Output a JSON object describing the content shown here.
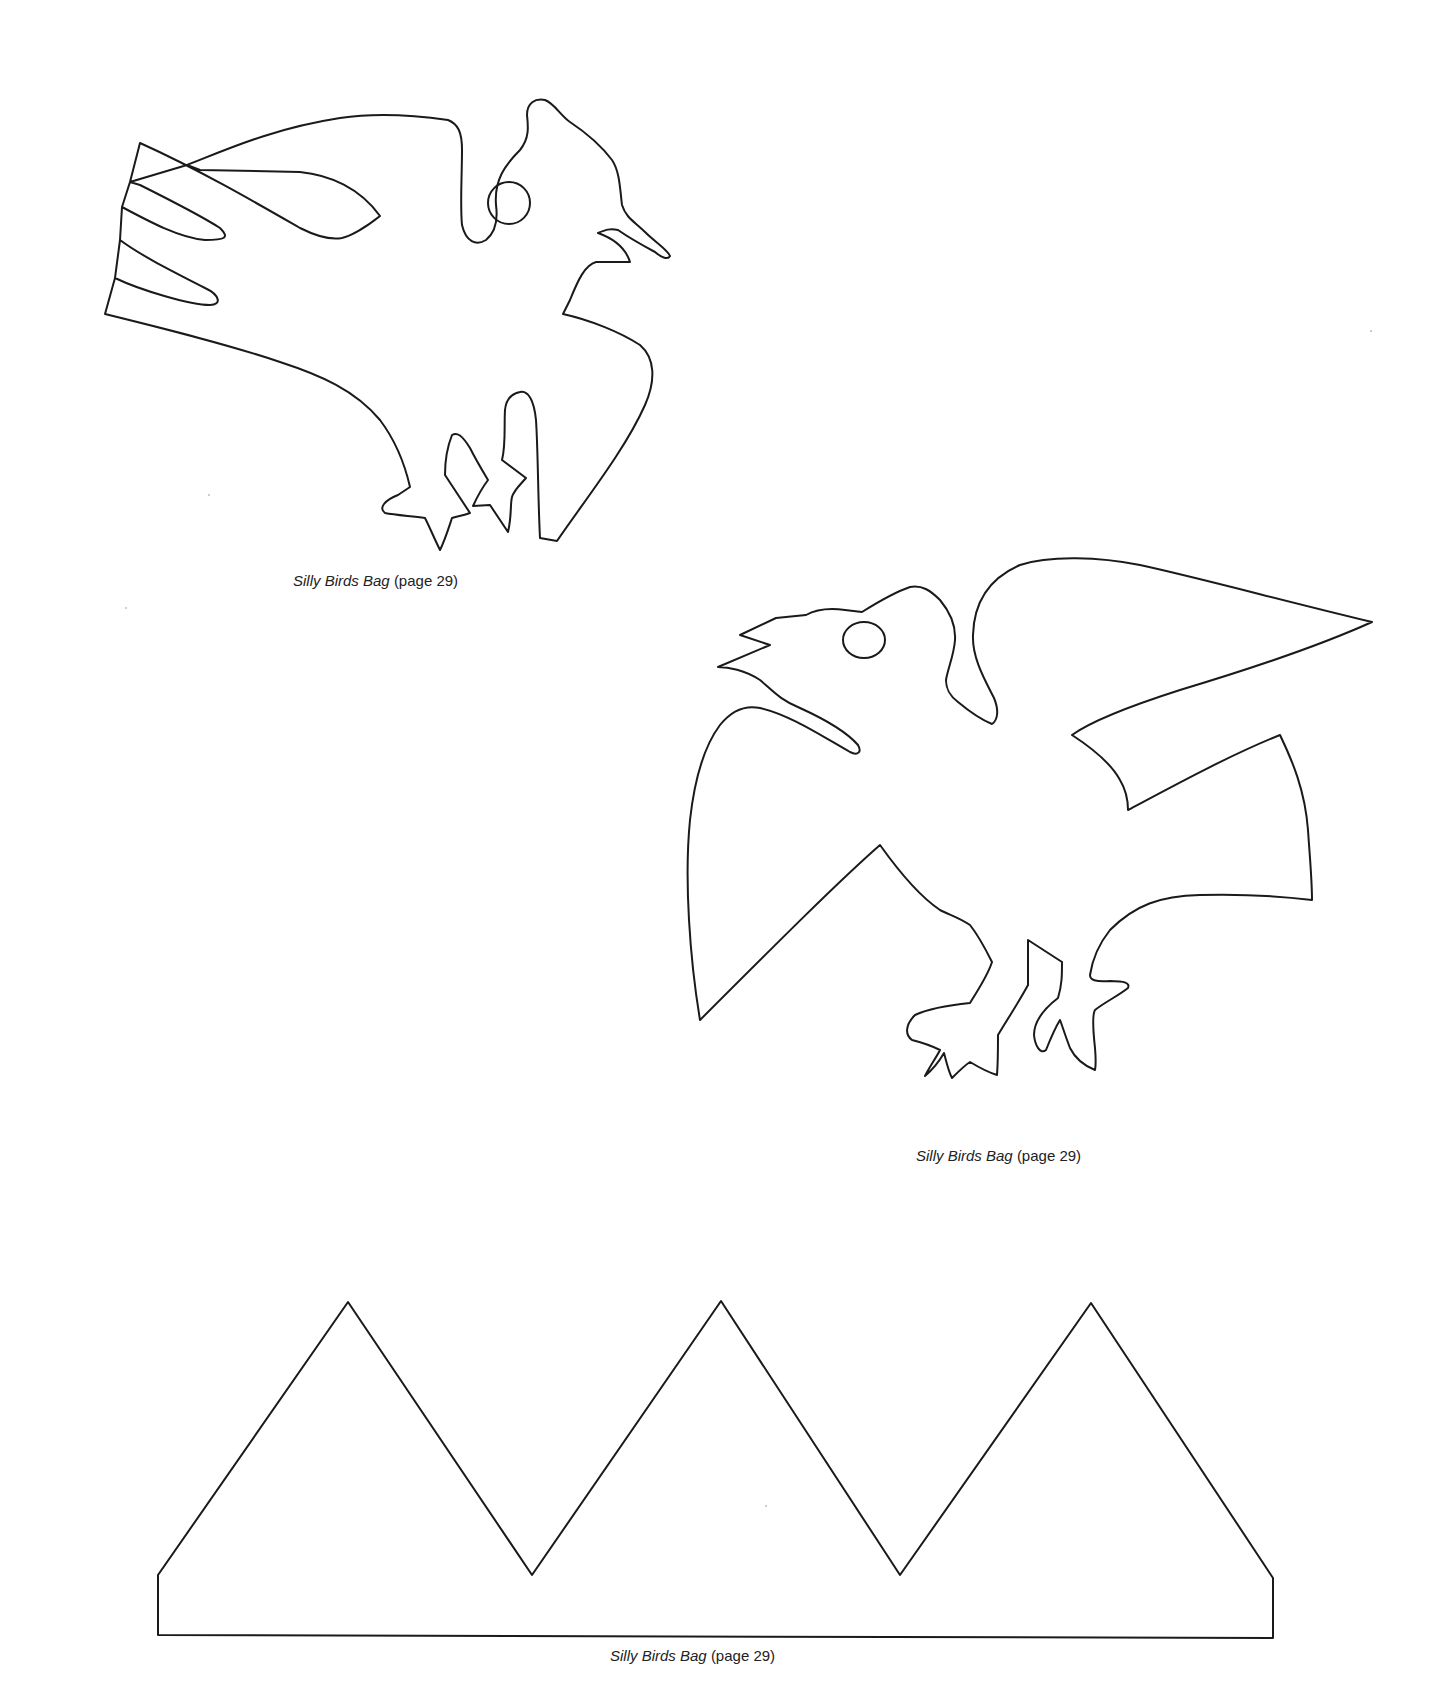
{
  "document": {
    "type": "craft template page",
    "templates": [
      {
        "name": "bird-1",
        "description": "crested bird with tail feathers, perched",
        "caption": {
          "title": "Silly Birds Bag",
          "ref": "(page 29)"
        }
      },
      {
        "name": "bird-2",
        "description": "bird with open beak and raised wings",
        "caption": {
          "title": "Silly Birds Bag",
          "ref": "(page 29)"
        }
      },
      {
        "name": "crown-band",
        "description": "zig-zag crown band with three peaks",
        "caption": {
          "title": "Silly Birds Bag",
          "ref": "(page 29)"
        }
      }
    ]
  },
  "style": {
    "line_color": "#1a1a1a",
    "background": "#ffffff"
  }
}
